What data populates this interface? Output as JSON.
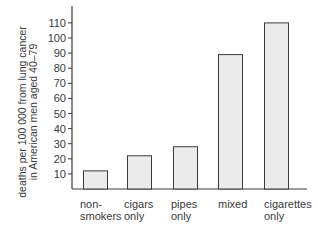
{
  "chart_data": {
    "type": "bar",
    "title": "",
    "xlabel": "",
    "ylabel": [
      "deaths per 100 000 from lung cancer",
      "in American men aged 40–79"
    ],
    "categories": [
      [
        "non-",
        "smokers"
      ],
      [
        "cigars",
        "only"
      ],
      [
        "pipes",
        "only"
      ],
      [
        "mixed"
      ],
      [
        "cigarettes",
        "only"
      ]
    ],
    "category_names": [
      "non-smokers",
      "cigars only",
      "pipes only",
      "mixed",
      "cigarettes only"
    ],
    "values": [
      12,
      22,
      28,
      89,
      110
    ],
    "ylim": [
      0,
      115
    ],
    "yticks": [
      10,
      20,
      30,
      40,
      50,
      60,
      70,
      80,
      90,
      100,
      110
    ],
    "grid": false,
    "legend": "none",
    "colors": {
      "bar_fill": "#ececec",
      "bar_stroke": "#3a3a3a",
      "axis": "#3a3a3a"
    }
  }
}
